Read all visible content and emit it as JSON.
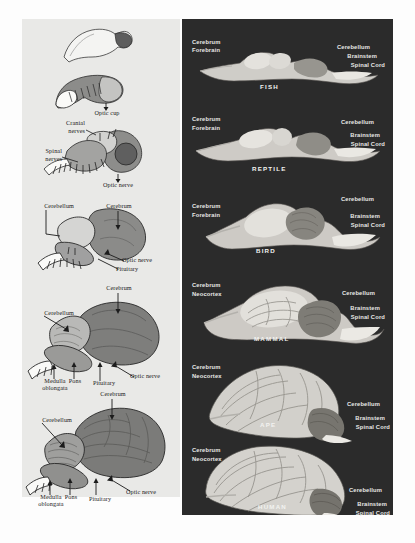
{
  "figure": {
    "panels": [
      "embryonic-development",
      "comparative-vertebrate-brains"
    ],
    "background_color": "#ffffff",
    "left_panel_color": "#e9e9e7",
    "right_panel_color": "#2b2b2b"
  },
  "left_panel": {
    "name": "embryonic brain development series",
    "stages": [
      {
        "index": 1,
        "labels": []
      },
      {
        "index": 2,
        "labels": [
          {
            "text": "Optic cup",
            "align": "center"
          }
        ]
      },
      {
        "index": 3,
        "labels": [
          {
            "text": "Cranial",
            "align": "right"
          },
          {
            "text": "nerves",
            "align": "right"
          },
          {
            "text": "Spinal",
            "align": "right"
          },
          {
            "text": "nerves",
            "align": "right"
          },
          {
            "text": "Optic nerve",
            "align": "center"
          }
        ]
      },
      {
        "index": 4,
        "labels": [
          {
            "text": "Cerebellum",
            "align": "right"
          },
          {
            "text": "Cerebrum",
            "align": "center"
          },
          {
            "text": "Optic nerve",
            "align": "left"
          },
          {
            "text": "Pituitary",
            "align": "left"
          }
        ]
      },
      {
        "index": 5,
        "labels": [
          {
            "text": "Cerebrum",
            "align": "center"
          },
          {
            "text": "Cerebellum",
            "align": "right"
          },
          {
            "text": "Pons",
            "align": "center"
          },
          {
            "text": "Medulla",
            "align": "center"
          },
          {
            "text": "oblongata",
            "align": "center"
          },
          {
            "text": "Pituitary",
            "align": "center"
          },
          {
            "text": "Optic nerve",
            "align": "left"
          }
        ]
      },
      {
        "index": 6,
        "labels": [
          {
            "text": "Cerebrum",
            "align": "center"
          },
          {
            "text": "Cerebellum",
            "align": "right"
          },
          {
            "text": "Pons",
            "align": "center"
          },
          {
            "text": "Medulla",
            "align": "center"
          },
          {
            "text": "oblongata",
            "align": "center"
          },
          {
            "text": "Pituitary",
            "align": "center"
          },
          {
            "text": "Optic nerve",
            "align": "left"
          }
        ]
      }
    ],
    "stage2_label": "Optic cup",
    "stage3": {
      "cranial_1": "Cranial",
      "cranial_2": "nerves",
      "spinal_1": "Spinal",
      "spinal_2": "nerves",
      "optic_nerve": "Optic nerve"
    },
    "stage4": {
      "cerebellum": "Cerebellum",
      "cerebrum": "Cerebrum",
      "optic_nerve": "Optic nerve",
      "pituitary": "Pituitary"
    },
    "stage5": {
      "cerebrum": "Cerebrum",
      "cerebellum": "Cerebellum",
      "pons": "Pons",
      "medulla_1": "Medulla",
      "medulla_2": "oblongata",
      "pituitary": "Pituitary",
      "optic_nerve": "Optic nerve"
    },
    "stage6": {
      "cerebrum": "Cerebrum",
      "cerebellum": "Cerebellum",
      "pons": "Pons",
      "medulla_1": "Medulla",
      "medulla_2": "oblongata",
      "pituitary": "Pituitary",
      "optic_nerve": "Optic nerve"
    }
  },
  "right_panel": {
    "name": "comparative vertebrate brain series",
    "rows": [
      {
        "species": "FISH",
        "left_labels": [
          "Cerebrum",
          "Forebrain"
        ],
        "right_labels": [
          "Cerebellum",
          "Brainstem",
          "Spinal Cord"
        ]
      },
      {
        "species": "REPTILE",
        "left_labels": [
          "Cerebrum",
          "Forebrain"
        ],
        "right_labels": [
          "Cerebellum",
          "Brainstem",
          "Spinal Cord"
        ]
      },
      {
        "species": "BIRD",
        "left_labels": [
          "Cerebrum",
          "Forebrain"
        ],
        "right_labels": [
          "Cerebellum",
          "Brainstem",
          "Spinal Cord"
        ]
      },
      {
        "species": "MAMMAL",
        "left_labels": [
          "Cerebrum",
          "Neocortex"
        ],
        "right_labels": [
          "Cerebellum",
          "Brainstem",
          "Spinal Cord"
        ]
      },
      {
        "species": "APE",
        "left_labels": [
          "Cerebrum",
          "Neocortex"
        ],
        "right_labels": [
          "Cerebellum",
          "Brainstem",
          "Spinal Cord"
        ]
      },
      {
        "species": "HUMAN",
        "left_labels": [
          "Cerebrum",
          "Neocortex"
        ],
        "right_labels": [
          "Cerebellum",
          "Brainstem",
          "Spinal Cord"
        ]
      }
    ]
  }
}
